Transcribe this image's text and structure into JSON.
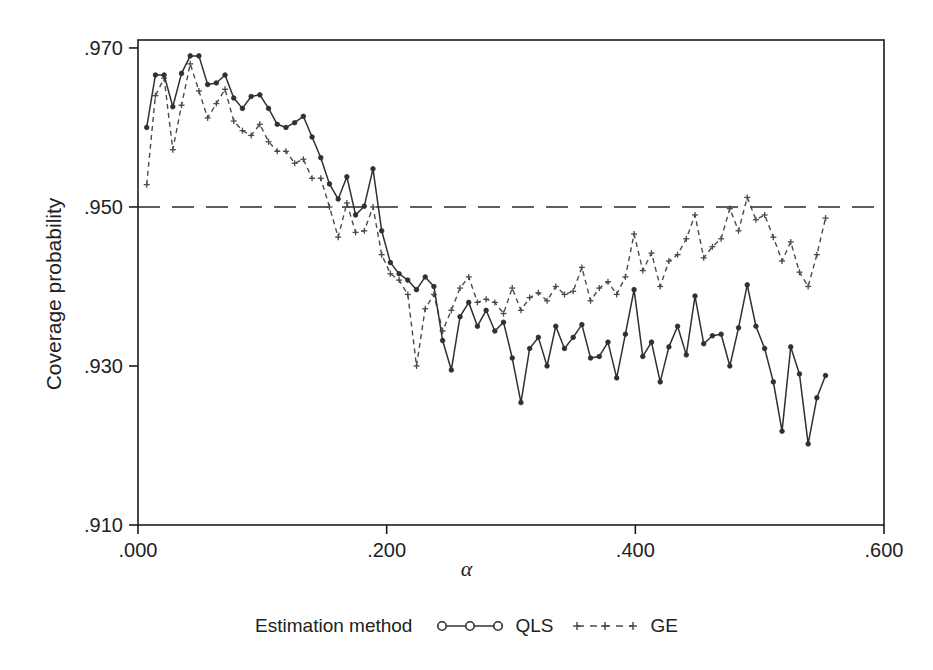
{
  "chart_data": {
    "type": "line",
    "title": "",
    "xlabel": "α",
    "ylabel": "Coverage probability",
    "xlim": [
      0.0,
      0.6
    ],
    "ylim": [
      0.91,
      0.971
    ],
    "xticks": [
      ".000",
      ".200",
      ".400",
      ".600"
    ],
    "xtick_values": [
      0.0,
      0.2,
      0.4,
      0.6
    ],
    "yticks": [
      ".970",
      ".950",
      ".930",
      ".910"
    ],
    "ytick_values": [
      0.97,
      0.95,
      0.93,
      0.91
    ],
    "grid": false,
    "reference_line": {
      "y": 0.95,
      "style": "dashed",
      "label": ".950"
    },
    "legend": {
      "position": "bottom",
      "title": "Estimation method",
      "entries": [
        {
          "name": "QLS",
          "style": "solid",
          "marker": "circle",
          "color": "#303030"
        },
        {
          "name": "GE",
          "style": "dashed",
          "marker": "plus",
          "color": "#4a4a4a"
        }
      ]
    },
    "x": [
      0.007,
      0.014,
      0.021,
      0.028,
      0.035,
      0.042,
      0.049,
      0.056,
      0.063,
      0.07,
      0.077,
      0.084,
      0.091,
      0.098,
      0.105,
      0.112,
      0.119,
      0.126,
      0.133,
      0.14,
      0.147,
      0.154,
      0.161,
      0.168,
      0.175,
      0.182,
      0.189,
      0.196,
      0.203,
      0.21,
      0.217,
      0.224,
      0.231,
      0.238,
      0.245,
      0.252,
      0.259,
      0.266,
      0.273,
      0.28,
      0.287,
      0.294,
      0.301,
      0.308,
      0.315,
      0.322,
      0.329,
      0.336,
      0.343,
      0.35,
      0.357,
      0.364,
      0.371,
      0.378,
      0.385,
      0.392,
      0.399,
      0.406,
      0.413,
      0.42,
      0.427,
      0.434,
      0.441,
      0.448,
      0.455,
      0.462,
      0.469,
      0.476,
      0.483,
      0.49,
      0.497,
      0.504,
      0.511,
      0.518,
      0.525,
      0.532,
      0.539,
      0.546,
      0.553
    ],
    "series": [
      {
        "name": "QLS",
        "style": "solid",
        "marker": "circle",
        "color": "#303030",
        "values": [
          0.96,
          0.9666,
          0.9666,
          0.9626,
          0.9668,
          0.969,
          0.969,
          0.9654,
          0.9656,
          0.9666,
          0.9637,
          0.9624,
          0.9639,
          0.9641,
          0.9624,
          0.9604,
          0.96,
          0.9606,
          0.9614,
          0.9588,
          0.9562,
          0.9529,
          0.951,
          0.9538,
          0.949,
          0.9501,
          0.9548,
          0.947,
          0.943,
          0.9416,
          0.9408,
          0.9396,
          0.9412,
          0.94,
          0.9332,
          0.9295,
          0.9362,
          0.938,
          0.935,
          0.937,
          0.9344,
          0.9355,
          0.931,
          0.9254,
          0.9322,
          0.9336,
          0.93,
          0.935,
          0.9322,
          0.9336,
          0.9352,
          0.931,
          0.9312,
          0.933,
          0.9285,
          0.934,
          0.9396,
          0.9312,
          0.933,
          0.928,
          0.9324,
          0.935,
          0.9314,
          0.9388,
          0.9328,
          0.9338,
          0.934,
          0.93,
          0.9348,
          0.9402,
          0.935,
          0.9322,
          0.928,
          0.9218,
          0.9324,
          0.929,
          0.9202,
          0.926,
          0.9288
        ]
      },
      {
        "name": "GE",
        "style": "dashed",
        "marker": "plus",
        "color": "#4a4a4a",
        "values": [
          0.9528,
          0.964,
          0.9662,
          0.9572,
          0.9628,
          0.968,
          0.9646,
          0.9612,
          0.963,
          0.9648,
          0.9608,
          0.9596,
          0.959,
          0.9604,
          0.9582,
          0.957,
          0.957,
          0.9555,
          0.956,
          0.9536,
          0.9536,
          0.95,
          0.9462,
          0.9505,
          0.9468,
          0.947,
          0.95,
          0.944,
          0.9416,
          0.9408,
          0.939,
          0.93,
          0.9372,
          0.939,
          0.9344,
          0.937,
          0.9398,
          0.9412,
          0.938,
          0.9384,
          0.938,
          0.9366,
          0.9398,
          0.937,
          0.9386,
          0.9392,
          0.9382,
          0.94,
          0.939,
          0.9394,
          0.9424,
          0.9382,
          0.9398,
          0.9406,
          0.939,
          0.9412,
          0.9466,
          0.942,
          0.9442,
          0.94,
          0.9432,
          0.944,
          0.946,
          0.949,
          0.9436,
          0.945,
          0.946,
          0.9498,
          0.947,
          0.9512,
          0.9484,
          0.949,
          0.9462,
          0.9432,
          0.9456,
          0.9418,
          0.94,
          0.944,
          0.9486
        ]
      }
    ]
  },
  "geometry": {
    "plot_left": 138,
    "plot_right": 884,
    "plot_top": 40,
    "plot_bottom": 525
  }
}
